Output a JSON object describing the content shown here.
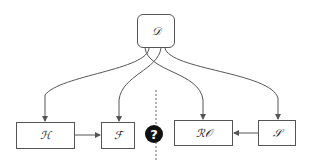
{
  "diagram": {
    "nodes": {
      "D": {
        "label": "𝒟"
      },
      "H": {
        "label": "ℋ"
      },
      "F": {
        "label": "ℱ"
      },
      "RO": {
        "label": "ℛ𝒪"
      },
      "S": {
        "label": "𝒮"
      }
    },
    "question_marker": {
      "label": "?"
    },
    "edges": [
      {
        "from": "D",
        "to": "H"
      },
      {
        "from": "D",
        "to": "F"
      },
      {
        "from": "D",
        "to": "RO"
      },
      {
        "from": "D",
        "to": "S"
      },
      {
        "from": "H",
        "to": "F"
      },
      {
        "from": "S",
        "to": "RO"
      }
    ],
    "colors": {
      "stroke": "#555555",
      "marker": "#111111"
    }
  }
}
